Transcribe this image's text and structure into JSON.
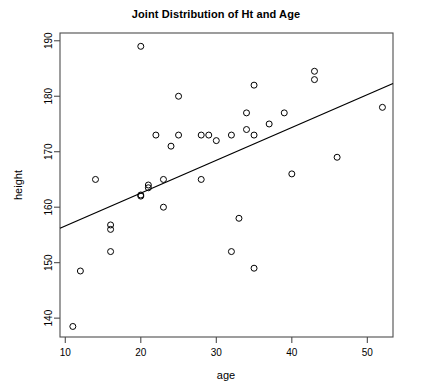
{
  "chart_data": {
    "type": "scatter",
    "title": "Joint Distribution of Ht and Age",
    "xlabel": "age",
    "ylabel": "height",
    "xlim": [
      9.3,
      53.4
    ],
    "ylim": [
      136.6,
      191.4
    ],
    "xticks": [
      10,
      20,
      30,
      40,
      50
    ],
    "xtick_labels": [
      "10",
      "20",
      "30",
      "40",
      "50"
    ],
    "yticks": [
      140,
      150,
      160,
      170,
      180,
      190
    ],
    "ytick_labels": [
      "140",
      "150",
      "160",
      "170",
      "180",
      "190"
    ],
    "grid": false,
    "legend": null,
    "marker": "open-circle",
    "marker_size": 3,
    "series": [
      {
        "name": "observations",
        "x": [
          11,
          12,
          14,
          16,
          16,
          16,
          20,
          20,
          20,
          21,
          21,
          22,
          23,
          23,
          24,
          25,
          25,
          28,
          28,
          29,
          30,
          32,
          32,
          33,
          34,
          34,
          35,
          35,
          35,
          37,
          39,
          40,
          43,
          43,
          46,
          52
        ],
        "y": [
          138.5,
          148.5,
          165,
          156,
          156.8,
          152,
          189,
          162,
          162.2,
          163.5,
          164,
          173,
          160,
          165,
          171,
          173,
          180,
          165,
          173,
          173,
          172,
          152,
          173,
          158,
          177,
          174,
          149,
          182,
          173,
          175,
          177,
          166,
          183,
          184.5,
          169,
          178
        ]
      }
    ],
    "fit_line": {
      "name": "regression line",
      "x": [
        9.3,
        53.4
      ],
      "y": [
        156.2,
        182.3
      ],
      "slope": 0.592,
      "intercept": 150.7
    }
  }
}
